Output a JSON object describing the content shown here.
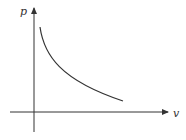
{
  "diagram": {
    "type": "p-v isotherm curve",
    "y_axis_label": "p",
    "x_axis_label": "v",
    "curve": "hyperbola (p inversely proportional to v)",
    "line_color": "#333333"
  }
}
